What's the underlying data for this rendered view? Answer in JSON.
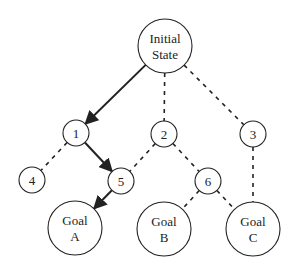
{
  "diagram": {
    "nodes": [
      {
        "id": "init",
        "lines": [
          "Initial",
          "State"
        ],
        "x": 165,
        "y": 46,
        "r": 27
      },
      {
        "id": "n1",
        "lines": [
          "1"
        ],
        "x": 76,
        "y": 133,
        "r": 13
      },
      {
        "id": "n2",
        "lines": [
          "2"
        ],
        "x": 164,
        "y": 134,
        "r": 13
      },
      {
        "id": "n3",
        "lines": [
          "3"
        ],
        "x": 253,
        "y": 134,
        "r": 13
      },
      {
        "id": "n4",
        "lines": [
          "4"
        ],
        "x": 32,
        "y": 180,
        "r": 13
      },
      {
        "id": "n5",
        "lines": [
          "5"
        ],
        "x": 121,
        "y": 181,
        "r": 13
      },
      {
        "id": "n6",
        "lines": [
          "6"
        ],
        "x": 208,
        "y": 181,
        "r": 13
      },
      {
        "id": "goalA",
        "lines": [
          "Goal",
          "A"
        ],
        "x": 75,
        "y": 228,
        "r": 27
      },
      {
        "id": "goalB",
        "lines": [
          "Goal",
          "B"
        ],
        "x": 164,
        "y": 229,
        "r": 27
      },
      {
        "id": "goalC",
        "lines": [
          "Goal",
          "C"
        ],
        "x": 253,
        "y": 229,
        "r": 27
      }
    ],
    "edges": [
      {
        "from": "init",
        "to": "n1",
        "style": "solid-arrow"
      },
      {
        "from": "init",
        "to": "n2",
        "style": "dashed"
      },
      {
        "from": "init",
        "to": "n3",
        "style": "dashed"
      },
      {
        "from": "n1",
        "to": "n4",
        "style": "dashed"
      },
      {
        "from": "n1",
        "to": "n5",
        "style": "solid-arrow"
      },
      {
        "from": "n2",
        "to": "n5",
        "style": "dashed"
      },
      {
        "from": "n2",
        "to": "n6",
        "style": "dashed"
      },
      {
        "from": "n3",
        "to": "goalC",
        "style": "dashed"
      },
      {
        "from": "n5",
        "to": "goalA",
        "style": "solid-arrow"
      },
      {
        "from": "n6",
        "to": "goalB",
        "style": "dashed"
      },
      {
        "from": "n6",
        "to": "goalC",
        "style": "dashed"
      }
    ],
    "colors": {
      "stroke": "#222222",
      "background": "#ffffff"
    }
  }
}
